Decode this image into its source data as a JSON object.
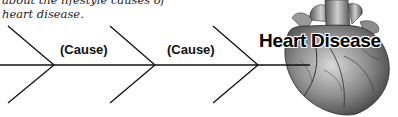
{
  "intro": {
    "line1": "about the lifestyle causes of",
    "line2": "heart disease."
  },
  "diagram": {
    "type": "fishbone",
    "causes": [
      {
        "label": "(Cause)"
      },
      {
        "label": "(Cause)"
      }
    ],
    "effect": {
      "label": "Heart Disease"
    },
    "image": "heart-illustration"
  }
}
